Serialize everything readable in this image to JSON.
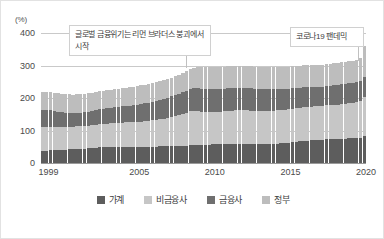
{
  "chart_data": {
    "type": "bar",
    "stacked": true,
    "title": "",
    "subtitle": "",
    "xlabel": "",
    "ylabel": "",
    "unit_label": "(%)",
    "ylim": [
      0,
      400
    ],
    "yticks": [
      0,
      100,
      200,
      300,
      400
    ],
    "grid": true,
    "legend_position": "bottom",
    "x_tick_labels": [
      "1999",
      "2005",
      "2010",
      "2015",
      "2020"
    ],
    "x_tick_years": [
      1999,
      2005,
      2010,
      2015,
      2020
    ],
    "x_range": [
      1999,
      2020.5
    ],
    "categories": [
      "1999Q1",
      "1999Q2",
      "1999Q3",
      "1999Q4",
      "2000Q1",
      "2000Q2",
      "2000Q3",
      "2000Q4",
      "2001Q1",
      "2001Q2",
      "2001Q3",
      "2001Q4",
      "2002Q1",
      "2002Q2",
      "2002Q3",
      "2002Q4",
      "2003Q1",
      "2003Q2",
      "2003Q3",
      "2003Q4",
      "2004Q1",
      "2004Q2",
      "2004Q3",
      "2004Q4",
      "2005Q1",
      "2005Q2",
      "2005Q3",
      "2005Q4",
      "2006Q1",
      "2006Q2",
      "2006Q3",
      "2006Q4",
      "2007Q1",
      "2007Q2",
      "2007Q3",
      "2007Q4",
      "2008Q1",
      "2008Q2",
      "2008Q3",
      "2008Q4",
      "2009Q1",
      "2009Q2",
      "2009Q3",
      "2009Q4",
      "2010Q1",
      "2010Q2",
      "2010Q3",
      "2010Q4",
      "2011Q1",
      "2011Q2",
      "2011Q3",
      "2011Q4",
      "2012Q1",
      "2012Q2",
      "2012Q3",
      "2012Q4",
      "2013Q1",
      "2013Q2",
      "2013Q3",
      "2013Q4",
      "2014Q1",
      "2014Q2",
      "2014Q3",
      "2014Q4",
      "2015Q1",
      "2015Q2",
      "2015Q3",
      "2015Q4",
      "2016Q1",
      "2016Q2",
      "2016Q3",
      "2016Q4",
      "2017Q1",
      "2017Q2",
      "2017Q3",
      "2017Q4",
      "2018Q1",
      "2018Q2",
      "2018Q3",
      "2018Q4",
      "2019Q1",
      "2019Q2",
      "2019Q3",
      "2019Q4",
      "2020Q1",
      "2020Q2"
    ],
    "series": [
      {
        "name": "가계",
        "color": "#5d5d5d",
        "stack_order": 1,
        "values": [
          38,
          38,
          39,
          39,
          40,
          41,
          41,
          42,
          42,
          43,
          43,
          44,
          45,
          46,
          47,
          48,
          48,
          48,
          48,
          48,
          48,
          48,
          48,
          48,
          48,
          48,
          49,
          49,
          49,
          50,
          50,
          51,
          51,
          51,
          52,
          52,
          52,
          53,
          53,
          54,
          54,
          55,
          55,
          56,
          56,
          57,
          57,
          57,
          57,
          58,
          58,
          58,
          58,
          58,
          58,
          58,
          58,
          58,
          58,
          58,
          59,
          59,
          60,
          61,
          62,
          63,
          64,
          66,
          67,
          68,
          69,
          70,
          71,
          72,
          72,
          73,
          73,
          74,
          74,
          75,
          75,
          76,
          76,
          77,
          78,
          83
        ]
      },
      {
        "name": "비금융사",
        "color": "#c6c6c6",
        "stack_order": 2,
        "values": [
          73,
          73,
          73,
          72,
          71,
          70,
          70,
          70,
          70,
          70,
          70,
          70,
          70,
          70,
          71,
          71,
          72,
          73,
          74,
          75,
          76,
          76,
          77,
          77,
          77,
          77,
          78,
          79,
          80,
          81,
          82,
          84,
          86,
          88,
          90,
          93,
          96,
          99,
          102,
          105,
          105,
          104,
          103,
          102,
          101,
          101,
          101,
          101,
          102,
          103,
          103,
          104,
          104,
          104,
          104,
          103,
          103,
          102,
          102,
          102,
          102,
          102,
          102,
          102,
          102,
          102,
          103,
          103,
          103,
          103,
          103,
          103,
          103,
          103,
          103,
          104,
          104,
          105,
          106,
          107,
          108,
          109,
          110,
          111,
          113,
          120
        ]
      },
      {
        "name": "금융사",
        "color": "#6f6f6f",
        "stack_order": 3,
        "values": [
          52,
          51,
          50,
          49,
          47,
          45,
          44,
          43,
          42,
          42,
          42,
          42,
          43,
          44,
          45,
          46,
          46,
          47,
          48,
          48,
          49,
          50,
          51,
          52,
          53,
          54,
          55,
          56,
          57,
          58,
          59,
          60,
          61,
          62,
          63,
          64,
          65,
          67,
          68,
          70,
          71,
          71,
          71,
          71,
          71,
          71,
          70,
          70,
          70,
          70,
          70,
          70,
          70,
          70,
          69,
          69,
          68,
          68,
          67,
          67,
          66,
          66,
          65,
          65,
          64,
          64,
          63,
          63,
          62,
          62,
          61,
          61,
          60,
          60,
          60,
          60,
          60,
          60,
          60,
          60,
          60,
          60,
          60,
          60,
          60,
          62
        ]
      },
      {
        "name": "정부",
        "color": "#bdbdbd",
        "stack_order": 4,
        "values": [
          57,
          57,
          57,
          57,
          56,
          56,
          56,
          56,
          56,
          56,
          56,
          56,
          56,
          56,
          56,
          56,
          56,
          56,
          56,
          56,
          56,
          56,
          56,
          56,
          57,
          57,
          57,
          57,
          58,
          58,
          58,
          58,
          58,
          58,
          58,
          58,
          58,
          58,
          59,
          60,
          62,
          64,
          66,
          68,
          68,
          68,
          68,
          68,
          68,
          68,
          68,
          68,
          68,
          68,
          68,
          68,
          68,
          68,
          68,
          68,
          68,
          68,
          68,
          68,
          68,
          68,
          68,
          68,
          68,
          68,
          68,
          68,
          68,
          68,
          68,
          68,
          68,
          68,
          68,
          68,
          68,
          68,
          69,
          70,
          73,
          95
        ]
      }
    ],
    "annotations": [
      {
        "id": "crisis",
        "text": "글로벌 금융위기는 리먼 브라더스 붕괴에서 시작",
        "points_to": "2008Q3"
      },
      {
        "id": "covid",
        "text": "코로나19 팬데믹",
        "points_to": "2020Q2"
      }
    ]
  }
}
